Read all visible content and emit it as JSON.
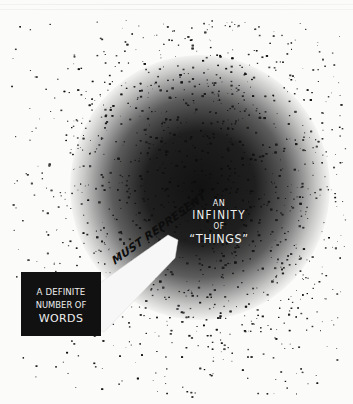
{
  "illustration": {
    "title": "Words and Things",
    "cloud_label": {
      "line1": "AN",
      "line2": "INFINITY",
      "line3": "OF",
      "line4": "“THINGS”"
    },
    "box_label": {
      "line1": "A DEFINITE",
      "line2": "NUMBER OF",
      "line3": "WORDS"
    },
    "banner_label": "MUST REPRESENT",
    "colors": {
      "paper": "#fbfbfa",
      "ink": "#111111",
      "label_text": "#f1f1f1",
      "banner_fill": "#f7f7f7"
    }
  }
}
